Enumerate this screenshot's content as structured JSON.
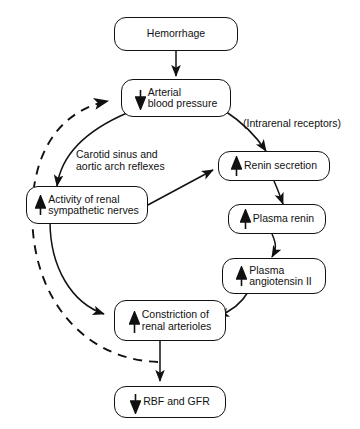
{
  "diagram": {
    "colors": {
      "stroke": "#111111",
      "background": "#ffffff",
      "text": "#111111"
    },
    "nodes": [
      {
        "id": "hemorrhage",
        "label": "Hemorrhage",
        "glyph": "none",
        "align": "center"
      },
      {
        "id": "arterial-bp",
        "label": "Arterial\nblood pressure",
        "glyph": "down-arrow",
        "align": "left"
      },
      {
        "id": "renin-secretion",
        "label": "Renin secretion",
        "glyph": "up-arrow",
        "align": "left"
      },
      {
        "id": "sympathetic-nerves",
        "label": "Activity of renal\nsympathetic nerves",
        "glyph": "up-arrow",
        "align": "left"
      },
      {
        "id": "plasma-renin",
        "label": "Plasma renin",
        "glyph": "up-arrow",
        "align": "left"
      },
      {
        "id": "plasma-angiotensin",
        "label": "Plasma\nangiotensin II",
        "glyph": "up-arrow",
        "align": "left"
      },
      {
        "id": "constriction",
        "label": "Constriction of\nrenal arterioles",
        "glyph": "up-arrow",
        "align": "left"
      },
      {
        "id": "rbf-gfr",
        "label": "RBF and GFR",
        "glyph": "down-arrow",
        "align": "left"
      }
    ],
    "annotations": [
      {
        "id": "intrarenal-receptors",
        "text": "(Intrarenal receptors)"
      },
      {
        "id": "carotid-reflexes",
        "text": "Carotid sinus and\naortic arch reflexes"
      }
    ],
    "edges": [
      {
        "from": "hemorrhage",
        "to": "arterial-bp",
        "style": "solid"
      },
      {
        "from": "arterial-bp",
        "to": "renin-secretion",
        "style": "solid"
      },
      {
        "from": "arterial-bp",
        "to": "sympathetic-nerves",
        "style": "solid"
      },
      {
        "from": "sympathetic-nerves",
        "to": "renin-secretion",
        "style": "solid"
      },
      {
        "from": "renin-secretion",
        "to": "plasma-renin",
        "style": "solid"
      },
      {
        "from": "plasma-renin",
        "to": "plasma-angiotensin",
        "style": "solid"
      },
      {
        "from": "plasma-angiotensin",
        "to": "constriction",
        "style": "solid"
      },
      {
        "from": "sympathetic-nerves",
        "to": "constriction",
        "style": "solid"
      },
      {
        "from": "constriction",
        "to": "rbf-gfr",
        "style": "solid"
      },
      {
        "from": "rbf-gfr",
        "to": "arterial-bp",
        "style": "dashed"
      }
    ]
  }
}
